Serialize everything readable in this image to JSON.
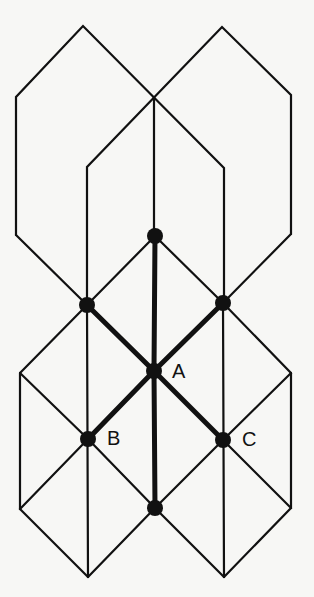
{
  "diagram": {
    "type": "lattice-graph",
    "colors": {
      "line": "#111111",
      "node": "#111111",
      "background": "#f7f7f5"
    },
    "labels": {
      "A": "A",
      "B": "B",
      "C": "C"
    },
    "nodes": [
      {
        "id": "top",
        "x": 155,
        "y": 236
      },
      {
        "id": "left-mid",
        "x": 87,
        "y": 305
      },
      {
        "id": "right-mid",
        "x": 223,
        "y": 303
      },
      {
        "id": "A",
        "x": 154,
        "y": 371,
        "label": "A"
      },
      {
        "id": "B",
        "x": 88,
        "y": 439,
        "label": "B"
      },
      {
        "id": "C",
        "x": 223,
        "y": 440,
        "label": "C"
      },
      {
        "id": "bottom",
        "x": 155,
        "y": 508
      }
    ],
    "highlighted_edges": [
      [
        "A",
        "top"
      ],
      [
        "A",
        "left-mid"
      ],
      [
        "A",
        "right-mid"
      ],
      [
        "A",
        "B"
      ],
      [
        "A",
        "C"
      ],
      [
        "A",
        "bottom"
      ]
    ]
  }
}
